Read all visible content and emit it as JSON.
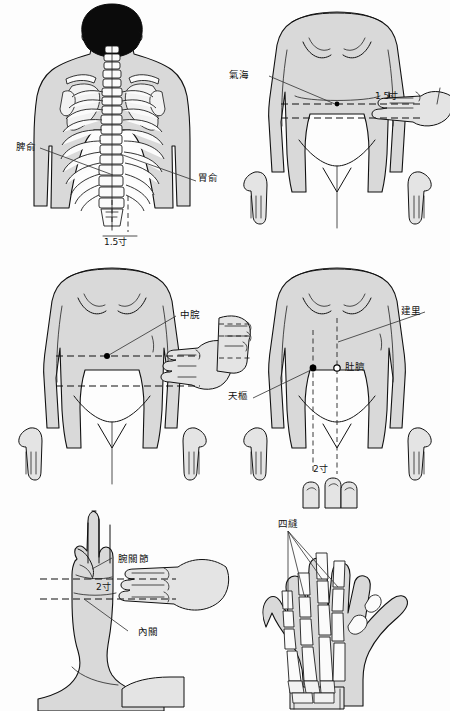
{
  "document": {
    "title": "針灸穴位圖解",
    "background_color": "#fdfdfd",
    "ink_color": "#111111",
    "skin_fill": "#d9d9d9"
  },
  "panels": [
    {
      "id": "panel-back",
      "position": "top-left",
      "view": "posterior torso with spine and ribcage",
      "labels": [
        {
          "name": "pishu",
          "text": "脾俞"
        },
        {
          "name": "weishu",
          "text": "胃俞"
        },
        {
          "name": "measure",
          "text": "1.5寸"
        }
      ]
    },
    {
      "id": "panel-qihai",
      "position": "top-right",
      "view": "anterior female torso with hand measuring",
      "labels": [
        {
          "name": "qihai",
          "text": "氣海"
        },
        {
          "name": "measure",
          "text": "1.5寸"
        }
      ]
    },
    {
      "id": "panel-zhongwan",
      "position": "middle-left",
      "view": "anterior female torso with hand measuring",
      "labels": [
        {
          "name": "zhongwan",
          "text": "中脘"
        }
      ]
    },
    {
      "id": "panel-jianli",
      "position": "middle-right",
      "view": "anterior female torso with navel and finger measuring",
      "labels": [
        {
          "name": "jianli",
          "text": "建里"
        },
        {
          "name": "tianshu",
          "text": "天樞"
        },
        {
          "name": "duqi",
          "text": "肚臍"
        },
        {
          "name": "measure",
          "text": "2寸"
        }
      ]
    },
    {
      "id": "panel-neiguan",
      "position": "bottom-left",
      "view": "forearm and palm with hand measuring",
      "labels": [
        {
          "name": "wanguanjie",
          "text": "腕關節"
        },
        {
          "name": "neiguan",
          "text": "內關"
        },
        {
          "name": "measure",
          "text": "2寸"
        }
      ]
    },
    {
      "id": "panel-sifeng",
      "position": "bottom-right",
      "view": "palmar hand skeleton",
      "labels": [
        {
          "name": "sifeng",
          "text": "四縫"
        }
      ]
    }
  ]
}
